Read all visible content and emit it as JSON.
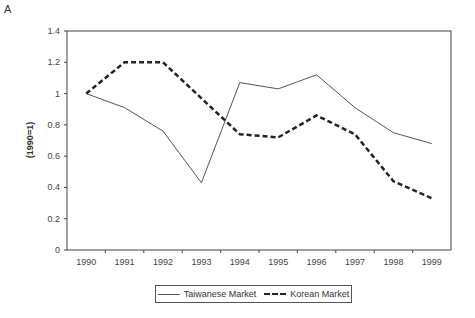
{
  "chart_data": {
    "type": "line",
    "panel_label": "A",
    "title": "",
    "xlabel": "",
    "ylabel": "(1990=1)",
    "ylim": [
      0,
      1.4
    ],
    "yticks": [
      "0",
      "0.2",
      "0.4",
      "0.6",
      "0.8",
      "1",
      "1.2",
      "1.4"
    ],
    "categories": [
      "1990",
      "1991",
      "1992",
      "1993",
      "1994",
      "1995",
      "1996",
      "1997",
      "1998",
      "1999"
    ],
    "series": [
      {
        "name": "Taiwanese Market",
        "style": "solid",
        "values": [
          1.0,
          0.91,
          0.76,
          0.43,
          1.07,
          1.03,
          1.12,
          0.91,
          0.75,
          0.68
        ]
      },
      {
        "name": "Korean Market",
        "style": "dashed",
        "values": [
          1.0,
          1.2,
          1.2,
          0.97,
          0.74,
          0.72,
          0.86,
          0.74,
          0.44,
          0.33
        ]
      }
    ],
    "grid": false,
    "legend_position": "bottom"
  }
}
